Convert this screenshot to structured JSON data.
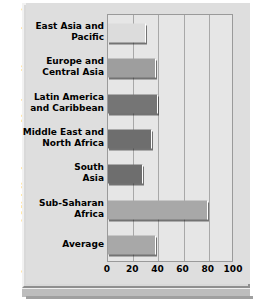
{
  "chart_data": {
    "type": "bar",
    "orientation": "horizontal",
    "title": "",
    "ylabel": "Low- and Middle-Income Nations  (by region)",
    "xlabel": "",
    "xlim": [
      0,
      100
    ],
    "xticks": [
      0,
      20,
      40,
      60,
      80,
      100
    ],
    "xtick_labels": [
      "0",
      "20",
      "40",
      "60",
      "80",
      "100"
    ],
    "grid": true,
    "legend": "none",
    "categories": [
      "East Asia and Pacific",
      "Europe and Central Asia",
      "Latin America and Caribbean",
      "Middle East and North Africa",
      "South Asia",
      "Sub-Saharan Africa",
      "Average"
    ],
    "category_lines": [
      [
        "East Asia and",
        "Pacific"
      ],
      [
        "Europe and",
        "Central Asia"
      ],
      [
        "Latin America",
        "and Caribbean"
      ],
      [
        "Middle East and",
        "North Africa"
      ],
      [
        "South",
        "Asia"
      ],
      [
        "Sub-Saharan",
        "Africa"
      ],
      [
        "Average"
      ]
    ],
    "values": [
      30,
      38,
      40,
      35,
      28,
      79,
      38
    ],
    "bar_colors": [
      "#dcdcdc",
      "#9e9e9e",
      "#757575",
      "#6e6e6e",
      "#6e6e6e",
      "#a8a8a8",
      "#a8a8a8"
    ]
  },
  "colors": {
    "panel_face": "#dedede",
    "plot_face": "#e6e6e6",
    "plot_border": "#9a9a9a",
    "gridline": "#a8a8a8",
    "text": "#000000"
  }
}
